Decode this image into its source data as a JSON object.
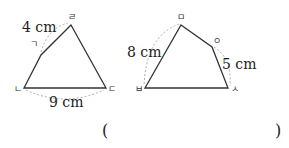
{
  "figures": [
    {
      "name": "quadrilateral-1",
      "vertices": {
        "top": "ㄹ",
        "left_upper": "ㄱ",
        "bottom_left": "ㄴ",
        "bottom_right": "ㄷ"
      },
      "measurements": {
        "top_side": "4 cm",
        "bottom_side": "9 cm"
      }
    },
    {
      "name": "quadrilateral-2",
      "vertices": {
        "top": "ㅁ",
        "right_upper": "ㅇ",
        "bottom_right": "ㅅ",
        "bottom_left": "ㅂ"
      },
      "measurements": {
        "left_side": "8 cm",
        "right_side": "5 cm"
      }
    }
  ],
  "answer": {
    "open": "(",
    "close": ")"
  }
}
